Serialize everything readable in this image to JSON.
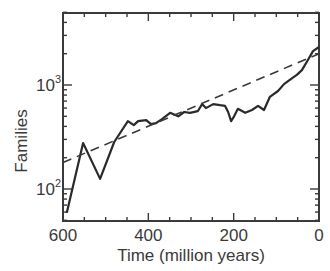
{
  "chart_data": {
    "type": "line",
    "title": "",
    "xlabel": "Time (million years)",
    "ylabel": "Families",
    "xlim": [
      600,
      0
    ],
    "ylim": [
      50,
      5000
    ],
    "yscale": "log",
    "x_ticks": [
      600,
      400,
      200,
      0
    ],
    "x_tick_labels": [
      "600",
      "400",
      "200",
      "0"
    ],
    "y_ticks": [
      100,
      1000
    ],
    "y_tick_labels": [
      {
        "base": "10",
        "exp": "2"
      },
      {
        "base": "10",
        "exp": "3"
      }
    ],
    "grid": false,
    "legend": null,
    "series": [
      {
        "name": "Families (observed)",
        "style": "solid",
        "color": "#2a2a2a",
        "x": [
          591,
          553,
          513,
          480,
          448,
          434,
          424,
          405,
          394,
          382,
          368,
          349,
          330,
          316,
          302,
          284,
          274,
          265,
          248,
          232,
          220,
          213,
          206,
          199,
          190,
          173,
          157,
          143,
          129,
          115,
          96,
          82,
          66,
          52,
          40,
          26,
          14,
          0
        ],
        "values": [
          59,
          277,
          125,
          283,
          450,
          412,
          450,
          460,
          420,
          430,
          470,
          540,
          500,
          550,
          540,
          560,
          655,
          600,
          655,
          640,
          630,
          550,
          450,
          500,
          590,
          540,
          575,
          630,
          575,
          770,
          875,
          1020,
          1140,
          1250,
          1390,
          1740,
          2120,
          2320
        ]
      },
      {
        "name": "Exponential fit",
        "style": "dashed",
        "color": "#3a3a3a",
        "x": [
          600,
          0
        ],
        "values": [
          180,
          2000
        ]
      }
    ]
  }
}
